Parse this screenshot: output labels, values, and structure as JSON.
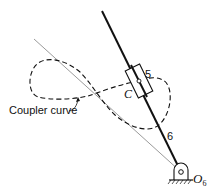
{
  "diagram": {
    "labels": {
      "coupler_curve": "Coupler curve",
      "slider_number": "5",
      "point_c": "C",
      "link_number": "6",
      "pivot_letter": "O",
      "pivot_subscript": "6"
    },
    "colors": {
      "stroke": "#111111",
      "thin_line": "#555555",
      "background": "#ffffff"
    }
  }
}
